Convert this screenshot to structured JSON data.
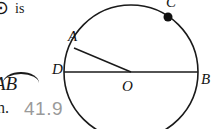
{
  "image": {
    "width": 216,
    "height": 129,
    "background_color": "#ffffff",
    "description": "Cropped geometry textbook page: circle diagram with partial problem text at left"
  },
  "text_fragments": {
    "circle_glyph": "⊙",
    "is_word": "is",
    "stub": "",
    "arc_label": "AB",
    "n_prefix": "n.",
    "answer_value": "41.9",
    "answer_color": "#9a9a9a"
  },
  "figure": {
    "type": "circle-diagram",
    "stroke_color": "#1a1a1a",
    "center": {
      "label": "O",
      "x": 131,
      "y": 72
    },
    "radius": 67,
    "points": [
      {
        "label": "A",
        "x": 74,
        "y": 48,
        "marker": "none"
      },
      {
        "label": "B",
        "x": 198,
        "y": 72,
        "marker": "none"
      },
      {
        "label": "C",
        "x": 168,
        "y": 17,
        "marker": "filled-dot"
      },
      {
        "label": "D",
        "x": 64,
        "y": 72,
        "marker": "none"
      }
    ],
    "segments": [
      {
        "name": "diameter-DB",
        "from": "D",
        "to": "B"
      },
      {
        "name": "radius-AO",
        "from": "A",
        "to": "O"
      }
    ],
    "dot_radius": 4.5,
    "dot_color": "#111111"
  }
}
